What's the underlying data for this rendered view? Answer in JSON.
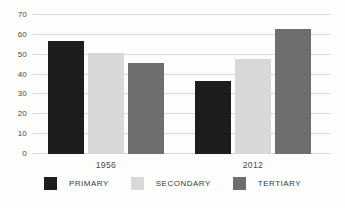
{
  "chart_data": {
    "type": "bar",
    "categories": [
      "1956",
      "2012"
    ],
    "series": [
      {
        "name": "PRIMARY",
        "color": "#1d1d1b",
        "values": [
          57,
          37
        ]
      },
      {
        "name": "SECONDARY",
        "color": "#d8d8d8",
        "values": [
          51,
          48
        ]
      },
      {
        "name": "TERTIARY",
        "color": "#6e6e6d",
        "values": [
          46,
          63
        ]
      }
    ],
    "title": "",
    "xlabel": "",
    "ylabel": "",
    "ylim": [
      0,
      70
    ],
    "yticks": [
      0,
      10,
      20,
      30,
      40,
      50,
      60,
      70
    ],
    "grid": true,
    "legend_position": "bottom",
    "colors": {
      "gridline": "#d8d8d6",
      "tick_text": "#4a4a48",
      "legend_text": "#3a3a38",
      "background": "#fdfdfc"
    }
  }
}
